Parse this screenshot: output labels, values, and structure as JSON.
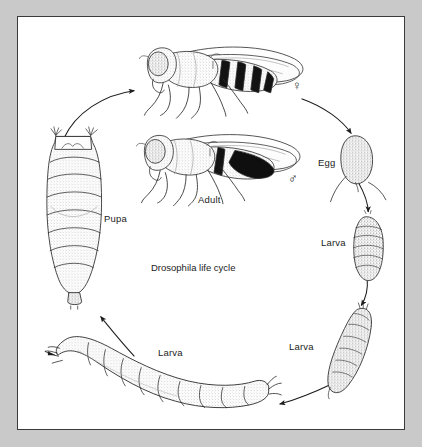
{
  "figure": {
    "title": "Drosophila life cycle",
    "background_color": "#c9c9c9",
    "panel_color": "#ffffff",
    "border_color": "#3a3a3a",
    "ink_color": "#1c1c1c"
  },
  "stages": [
    {
      "id": "adult-female",
      "label": "",
      "sex_symbol": "♀",
      "stage_name": "adult female fly"
    },
    {
      "id": "adult-male",
      "label": "Adult",
      "sex_symbol": "♂",
      "stage_name": "adult male fly"
    },
    {
      "id": "egg",
      "label": "Egg",
      "stage_name": "egg with dorsal filaments"
    },
    {
      "id": "larva-first",
      "label": "Larva",
      "stage_name": "first instar larva"
    },
    {
      "id": "larva-second",
      "label": "Larva",
      "stage_name": "second instar larva"
    },
    {
      "id": "larva-third",
      "label": "Larva",
      "stage_name": "third instar larva"
    },
    {
      "id": "pupa",
      "label": "Pupa",
      "stage_name": "pupa / puparium"
    }
  ],
  "arrows": [
    {
      "id": "arrow-female-to-egg",
      "from": "adult-female",
      "to": "egg"
    },
    {
      "id": "arrow-egg-to-larva1",
      "from": "egg",
      "to": "larva-first"
    },
    {
      "id": "arrow-larva1-to-larva2",
      "from": "larva-first",
      "to": "larva-second"
    },
    {
      "id": "arrow-larva2-to-larva3",
      "from": "larva-second",
      "to": "larva-third"
    },
    {
      "id": "arrow-larva3-to-pupa",
      "from": "larva-third",
      "to": "pupa"
    },
    {
      "id": "arrow-pupa-to-adult",
      "from": "pupa",
      "to": "adult-female"
    }
  ]
}
